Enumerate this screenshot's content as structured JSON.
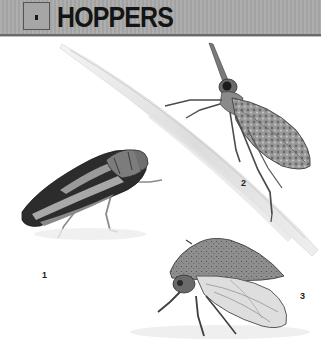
{
  "header": {
    "section_marker": "•",
    "title": "HOPPERS"
  },
  "figures": [
    {
      "label": "1",
      "description": "striped leafhopper, side view"
    },
    {
      "label": "2",
      "description": "long-snouted planthopper on stem"
    },
    {
      "label": "3",
      "description": "treehopper with clear veined wings"
    }
  ],
  "colors": {
    "header_bg": "#a9a9a9",
    "header_border": "#6a6a6a",
    "title": "#141414"
  }
}
